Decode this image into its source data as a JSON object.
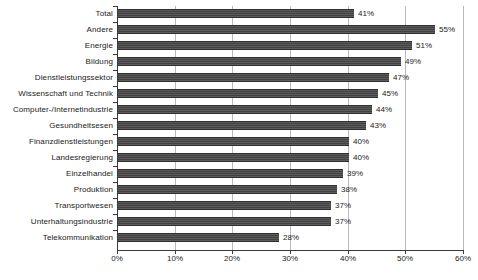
{
  "chart_data": {
    "type": "bar",
    "orientation": "horizontal",
    "title": "",
    "subtitle": "",
    "xlabel": "",
    "ylabel": "",
    "xlim": [
      0,
      60
    ],
    "xticks": [
      "0%",
      "10%",
      "20%",
      "30%",
      "40%",
      "50%",
      "60%"
    ],
    "xtick_values": [
      0,
      10,
      20,
      30,
      40,
      50,
      60
    ],
    "grid": true,
    "grid_axis": "x",
    "legend": false,
    "legend_position": "none",
    "value_suffix": "%",
    "categories": [
      "Total",
      "Andere",
      "Energie",
      "Bildung",
      "Dienstleistungssektor",
      "Wissenschaft und Technik",
      "Computer-/Internetindustrie",
      "Gesundheitsesen",
      "Finanzdienstleistungen",
      "Landesregierung",
      "Einzelhandel",
      "Produktion",
      "Transportwesen",
      "Unterhaltungsindustrie",
      "Telekommunikation"
    ],
    "values": [
      41,
      55,
      51,
      49,
      47,
      45,
      44,
      43,
      40,
      40,
      39,
      38,
      37,
      37,
      28
    ],
    "value_labels": [
      "41%",
      "55%",
      "51%",
      "49%",
      "47%",
      "45%",
      "44%",
      "43%",
      "40%",
      "40%",
      "39%",
      "38%",
      "37%",
      "37%",
      "28%"
    ],
    "colors": {
      "bar": "#4a4a4a",
      "bar_edge": "#2f2f2f",
      "gridline": "#b9b9b9",
      "axis": "#3a3a3a",
      "text": "#1a1a1a",
      "background": "#ffffff"
    }
  }
}
